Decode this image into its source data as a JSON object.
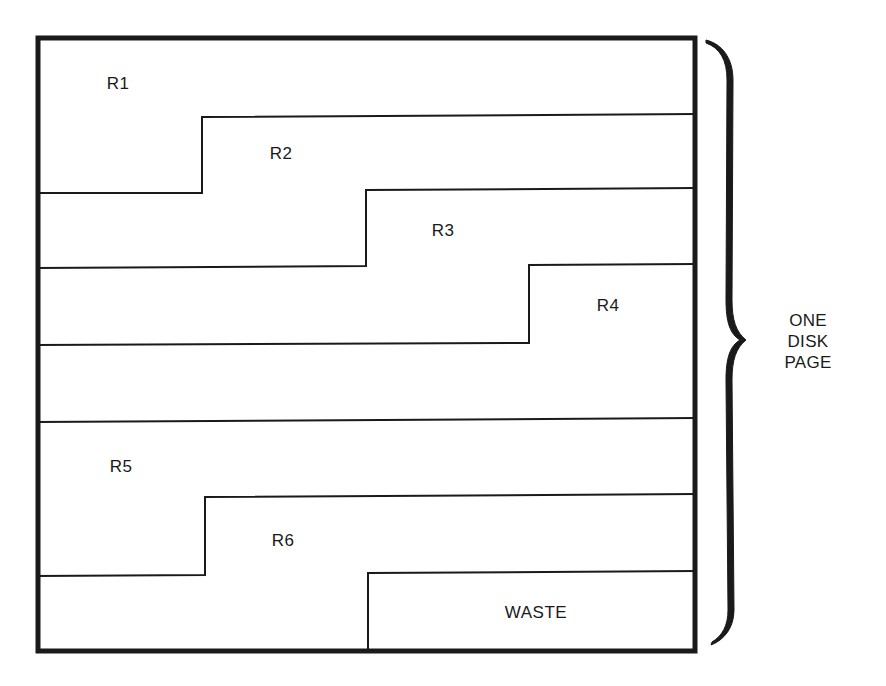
{
  "diagram": {
    "title": "",
    "colors": {
      "line": "#1a1a1a",
      "background": "#ffffff"
    },
    "page_box": {
      "left": 36,
      "top": 36,
      "right": 696,
      "bottom": 652
    },
    "records": [
      {
        "id": "R1",
        "label": "R1",
        "label_pos": [
          118,
          84
        ]
      },
      {
        "id": "R2",
        "label": "R2",
        "label_pos": [
          281,
          154
        ]
      },
      {
        "id": "R3",
        "label": "R3",
        "label_pos": [
          443,
          231
        ]
      },
      {
        "id": "R4",
        "label": "R4",
        "label_pos": [
          608,
          306
        ]
      },
      {
        "id": "R5",
        "label": "R5",
        "label_pos": [
          121,
          467
        ]
      },
      {
        "id": "R6",
        "label": "R6",
        "label_pos": [
          283,
          541
        ]
      },
      {
        "id": "WASTE",
        "label": "WASTE",
        "label_pos": [
          536,
          613
        ]
      }
    ],
    "boundaries": [
      {
        "points": [
          [
            36,
            193
          ],
          [
            202,
            193
          ],
          [
            202,
            117
          ],
          [
            696,
            114
          ]
        ]
      },
      {
        "points": [
          [
            36,
            268
          ],
          [
            366,
            266
          ],
          [
            366,
            190
          ],
          [
            696,
            188
          ]
        ]
      },
      {
        "points": [
          [
            36,
            345
          ],
          [
            529,
            343
          ],
          [
            529,
            265
          ],
          [
            696,
            264
          ]
        ]
      },
      {
        "points": [
          [
            36,
            422
          ],
          [
            696,
            418
          ]
        ]
      },
      {
        "points": [
          [
            36,
            576
          ],
          [
            205,
            575
          ],
          [
            205,
            497
          ],
          [
            696,
            494
          ]
        ]
      },
      {
        "points": [
          [
            368,
            652
          ],
          [
            368,
            573
          ],
          [
            696,
            571
          ]
        ]
      }
    ],
    "brace": {
      "label_lines": [
        "ONE DISK",
        "PAGE"
      ],
      "label_pos": [
        808,
        340
      ]
    }
  }
}
